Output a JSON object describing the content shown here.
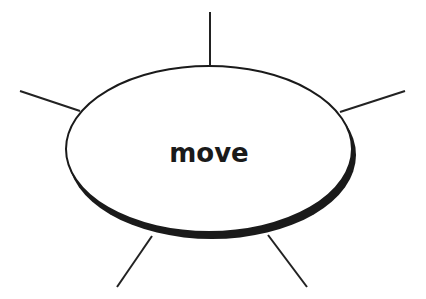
{
  "diagram": {
    "center_label": "move",
    "colors": {
      "stroke": "#1a1a1a",
      "fill": "#ffffff",
      "shadow": "#1a1a1a"
    },
    "spokes": [
      {
        "name": "top",
        "x1": 210,
        "y1": 12,
        "x2": 210,
        "y2": 66
      },
      {
        "name": "left",
        "x1": 20,
        "y1": 91,
        "x2": 80,
        "y2": 111
      },
      {
        "name": "right",
        "x1": 405,
        "y1": 91,
        "x2": 340,
        "y2": 112
      },
      {
        "name": "bottom-left",
        "x1": 152,
        "y1": 236,
        "x2": 117,
        "y2": 287
      },
      {
        "name": "bottom-right",
        "x1": 268,
        "y1": 235,
        "x2": 307,
        "y2": 287
      }
    ]
  }
}
